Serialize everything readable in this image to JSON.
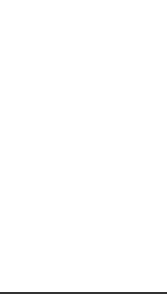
{
  "figure": {
    "caption": "Fig. 1a"
  },
  "colors": {
    "line": "#1a1a1a",
    "sashing": "#e6e6e6",
    "block": "#ffffff"
  },
  "assembled_quilt": {
    "rows": 3,
    "cols": 3,
    "block_pattern": "snowball-3x3"
  },
  "exploded_rows": [
    {
      "type": "block-row",
      "blocks": 3
    },
    {
      "type": "sashing-strip"
    },
    {
      "type": "block-row",
      "blocks": 3
    },
    {
      "type": "sashing-strip"
    },
    {
      "type": "block-row",
      "blocks": 3
    }
  ]
}
